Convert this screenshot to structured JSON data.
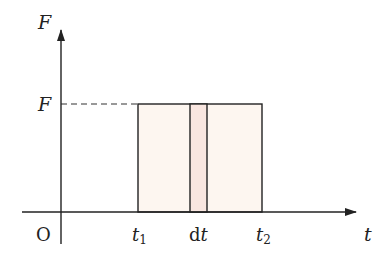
{
  "diagram": {
    "type": "force-time graph",
    "axes": {
      "y_label": "F",
      "x_label": "t",
      "origin_label": "O"
    },
    "level_label": "F",
    "ticks": {
      "t1": {
        "base": "t",
        "sub": "1"
      },
      "dt": {
        "prefix": "d",
        "var": "t"
      },
      "t2": {
        "base": "t",
        "sub": "2"
      }
    },
    "colors": {
      "axis": "#222222",
      "rect_fill": "#fdf6f0",
      "strip_fill": "#f9e6e0",
      "dash": "#333333"
    }
  }
}
